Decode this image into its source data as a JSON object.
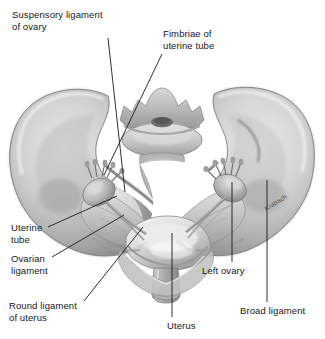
{
  "figure": {
    "background_color": "#ffffff",
    "line_color": "#1a1a1a",
    "text_color": "#17171a",
    "width": 325,
    "height": 339
  },
  "labels": [
    {
      "id": "suspensory-ligament-of-ovary",
      "line1": "Suspensory ligament",
      "line2": "of ovary",
      "x": 12,
      "y": 9
    },
    {
      "id": "fimbriae-of-uterine-tube",
      "line1": "Fimbriae of",
      "line2": "uterine tube",
      "x": 163,
      "y": 28
    },
    {
      "id": "uterine-tube",
      "line1": "Uterine",
      "line2": "tube",
      "x": 11,
      "y": 222
    },
    {
      "id": "ovarian-ligament",
      "line1": "Ovarian",
      "line2": "ligament",
      "x": 11,
      "y": 253
    },
    {
      "id": "round-ligament-of-uterus",
      "line1": "Round ligament",
      "line2": "of uterus",
      "x": 9,
      "y": 300
    },
    {
      "id": "uterus",
      "line1": "Uterus",
      "line2": "",
      "x": 167,
      "y": 320
    },
    {
      "id": "left-ovary",
      "line1": "Left ovary",
      "line2": "",
      "x": 202,
      "y": 265
    },
    {
      "id": "broad-ligament",
      "line1": "Broad ligament",
      "line2": "",
      "x": 240,
      "y": 305
    }
  ],
  "signature": {
    "text": "Krabach",
    "x": 263,
    "y": 206
  },
  "leader_lines": [
    {
      "id": "leader-suspensory-ligament",
      "x1": 108,
      "y1": 38,
      "x2": 125,
      "y2": 192
    },
    {
      "id": "leader-fimbriae",
      "x1": 162,
      "y1": 54,
      "x2": 104,
      "y2": 175
    },
    {
      "id": "leader-uterine-tube",
      "x1": 48,
      "y1": 227,
      "x2": 117,
      "y2": 196
    },
    {
      "id": "leader-ovarian-ligament",
      "x1": 52,
      "y1": 257,
      "x2": 124,
      "y2": 215
    },
    {
      "id": "leader-round-ligament",
      "x1": 84,
      "y1": 301,
      "x2": 143,
      "y2": 227
    },
    {
      "id": "leader-uterus",
      "x1": 172,
      "y1": 317,
      "x2": 172,
      "y2": 233
    },
    {
      "id": "leader-left-ovary",
      "x1": 232,
      "y1": 262,
      "x2": 232,
      "y2": 182
    },
    {
      "id": "leader-broad-ligament",
      "x1": 267,
      "y1": 302,
      "x2": 267,
      "y2": 180
    }
  ]
}
